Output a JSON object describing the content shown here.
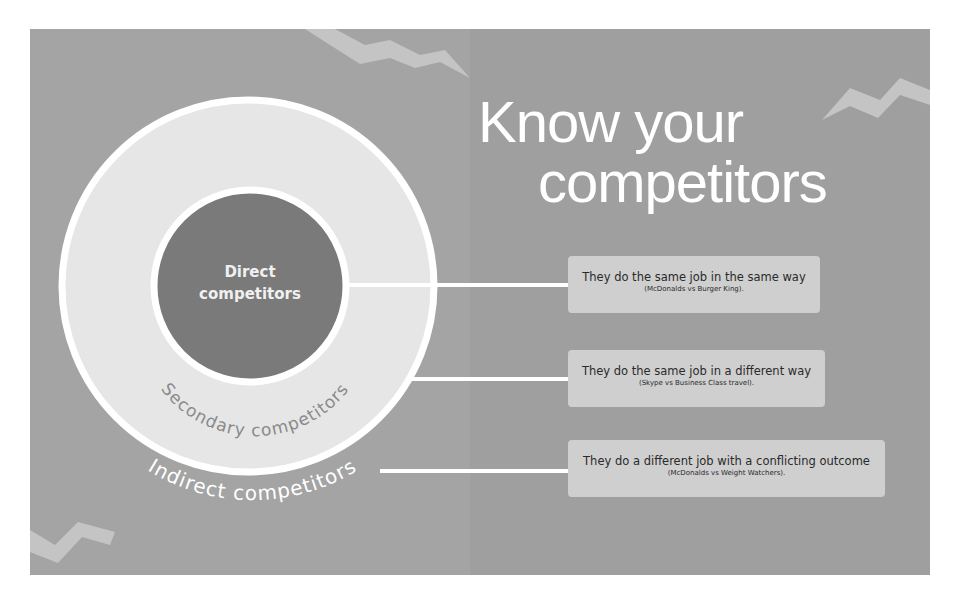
{
  "title": {
    "line1": "Know your",
    "line2": "competitors"
  },
  "rings": {
    "direct": "Direct competitors",
    "direct_line1": "Direct",
    "direct_line2": "competitors",
    "secondary": "Secondary competitors",
    "indirect": "Indirect competitors"
  },
  "descriptions": [
    {
      "main": "They do the same job in the same way",
      "example": "(McDonalds vs Burger King)."
    },
    {
      "main": "They do the same job in a different way",
      "example": "(Skype vs Business Class travel)."
    },
    {
      "main": "They do a different job with a conflicting outcome",
      "example": "(McDonalds vs Weight Watchers)."
    }
  ],
  "colors": {
    "background": "#a4a4a4",
    "outer_ring": "#e6e6e6",
    "inner_core": "#7a7a7a",
    "stroke": "#ffffff",
    "box": "#cfcfcf",
    "decoration": "#c4c4c4"
  }
}
